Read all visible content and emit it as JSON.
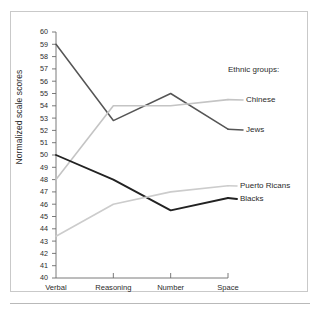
{
  "chart_data": {
    "type": "line",
    "title": "",
    "xlabel": "",
    "ylabel": "Normalized scale scores",
    "categories": [
      "Verbal",
      "Reasoning",
      "Number",
      "Space"
    ],
    "ylim": [
      40,
      60
    ],
    "yticks": [
      40,
      41,
      42,
      43,
      44,
      45,
      46,
      47,
      48,
      49,
      50,
      51,
      52,
      53,
      54,
      55,
      56,
      57,
      58,
      59,
      60
    ],
    "grid": false,
    "legend_position": "right-inline-labels",
    "legend_title": "Ethnic groups:",
    "series": [
      {
        "name": "Jews",
        "values": [
          59.0,
          52.8,
          55.0,
          52.1
        ],
        "color": "#555555"
      },
      {
        "name": "Chinese",
        "values": [
          48.0,
          54.0,
          54.0,
          54.5
        ],
        "color": "#c4c4c4"
      },
      {
        "name": "Blacks",
        "values": [
          50.0,
          48.0,
          45.5,
          46.5
        ],
        "color": "#222222"
      },
      {
        "name": "Puerto Ricans",
        "values": [
          43.4,
          46.0,
          47.0,
          47.5
        ],
        "color": "#cccccc"
      }
    ]
  },
  "axis": {
    "y_title": "Normalized scale scores"
  },
  "legend": {
    "title": "Ethnic groups:",
    "items": [
      {
        "label": "Chinese"
      },
      {
        "label": "Jews"
      },
      {
        "label": "Puerto Ricans"
      },
      {
        "label": "Blacks"
      }
    ]
  },
  "colors": {
    "frame": "#c9c9c9",
    "axis": "#6b6b6b",
    "text": "#2b2b2b",
    "background": "#ffffff"
  }
}
